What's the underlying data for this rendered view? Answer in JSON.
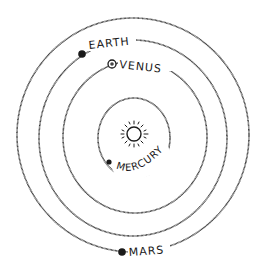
{
  "diagram": {
    "title": "",
    "center": {
      "name": "Sun",
      "cx": 133,
      "cy": 135
    },
    "orbits": [
      {
        "name": "Mercury",
        "label": "MERCURY",
        "rx": 36,
        "ry": 38
      },
      {
        "name": "Venus",
        "label": "VENUS",
        "rx": 72,
        "ry": 76
      },
      {
        "name": "Earth",
        "label": "EARTH",
        "rx": 94,
        "ry": 98
      },
      {
        "name": "Mars",
        "label": "MARS",
        "rx": 116,
        "ry": 117
      }
    ],
    "labels": {
      "earth": "EARTH",
      "venus": "VENUS",
      "mercury": "MERCURY",
      "mars": "MARS"
    },
    "colors": {
      "ink": "#1a1a1a",
      "background": "#ffffff"
    }
  }
}
